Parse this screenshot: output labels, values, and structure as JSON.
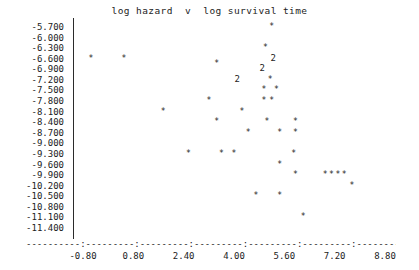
{
  "chart_data": {
    "type": "scatter",
    "title": "log hazard  v  log survival time",
    "xlabel": "",
    "ylabel": "",
    "xlim": [
      -1.6,
      9.6
    ],
    "ylim": [
      -11.55,
      -5.55
    ],
    "grid": false,
    "legend": null,
    "marker": "*",
    "multi_marker_note": "A digit glyph such as '2' marks a location where that many observations coincide.",
    "x_ticks": [
      "-0.80",
      "0.80",
      "2.40",
      "4.00",
      "5.60",
      "7.20",
      "8.80"
    ],
    "x_tick_values": [
      -0.8,
      0.8,
      2.4,
      4.0,
      5.6,
      7.2,
      8.8
    ],
    "y_ticks": [
      "-5.700",
      "-6.000",
      "-6.300",
      "-6.600",
      "-6.900",
      "-7.200",
      "-7.500",
      "-7.800",
      "-8.100",
      "-8.400",
      "-8.700",
      "-9.000",
      "-9.300",
      "-9.600",
      "-9.900",
      "-10.200",
      "-10.500",
      "-10.800",
      "-11.100",
      "-11.400"
    ],
    "y_tick_values": [
      -5.7,
      -6.0,
      -6.3,
      -6.6,
      -6.9,
      -7.2,
      -7.5,
      -7.8,
      -8.1,
      -8.4,
      -8.7,
      -9.0,
      -9.3,
      -9.6,
      -9.9,
      -10.2,
      -10.5,
      -10.8,
      -11.1,
      -11.4
    ],
    "points": [
      {
        "x": 5.2,
        "y": -5.7,
        "count": 1,
        "label": "*"
      },
      {
        "x": 5.0,
        "y": -6.3,
        "count": 1,
        "label": "*"
      },
      {
        "x": -0.55,
        "y": -6.6,
        "count": 1,
        "label": "*"
      },
      {
        "x": 0.5,
        "y": -6.6,
        "count": 1,
        "label": "*"
      },
      {
        "x": 5.25,
        "y": -6.6,
        "count": 2,
        "label": "2"
      },
      {
        "x": 3.45,
        "y": -6.75,
        "count": 1,
        "label": "*"
      },
      {
        "x": 4.9,
        "y": -6.9,
        "count": 2,
        "label": "2"
      },
      {
        "x": 4.1,
        "y": -7.2,
        "count": 2,
        "label": "2"
      },
      {
        "x": 5.15,
        "y": -7.2,
        "count": 1,
        "label": "*"
      },
      {
        "x": 4.95,
        "y": -7.5,
        "count": 1,
        "label": "*"
      },
      {
        "x": 5.35,
        "y": -7.5,
        "count": 1,
        "label": "*"
      },
      {
        "x": 3.2,
        "y": -7.8,
        "count": 1,
        "label": "*"
      },
      {
        "x": 4.95,
        "y": -7.8,
        "count": 1,
        "label": "*"
      },
      {
        "x": 5.2,
        "y": -7.8,
        "count": 1,
        "label": "*"
      },
      {
        "x": 1.75,
        "y": -8.1,
        "count": 1,
        "label": "*"
      },
      {
        "x": 4.25,
        "y": -8.1,
        "count": 1,
        "label": "*"
      },
      {
        "x": 10.55,
        "y": -8.1,
        "count": 1,
        "label": "*"
      },
      {
        "x": 3.45,
        "y": -8.4,
        "count": 1,
        "label": "*"
      },
      {
        "x": 5.05,
        "y": -8.4,
        "count": 1,
        "label": "*"
      },
      {
        "x": 5.95,
        "y": -8.4,
        "count": 1,
        "label": "*"
      },
      {
        "x": 4.45,
        "y": -8.7,
        "count": 1,
        "label": "*"
      },
      {
        "x": 5.45,
        "y": -8.7,
        "count": 1,
        "label": "*"
      },
      {
        "x": 5.95,
        "y": -8.7,
        "count": 1,
        "label": "*"
      },
      {
        "x": 2.55,
        "y": -9.3,
        "count": 1,
        "label": "*"
      },
      {
        "x": 3.6,
        "y": -9.3,
        "count": 1,
        "label": "*"
      },
      {
        "x": 4.0,
        "y": -9.3,
        "count": 1,
        "label": "*"
      },
      {
        "x": 5.9,
        "y": -9.3,
        "count": 1,
        "label": "*"
      },
      {
        "x": 5.45,
        "y": -9.6,
        "count": 1,
        "label": "*"
      },
      {
        "x": 5.95,
        "y": -9.9,
        "count": 1,
        "label": "*"
      },
      {
        "x": 6.9,
        "y": -9.9,
        "count": 1,
        "label": "*"
      },
      {
        "x": 7.1,
        "y": -9.9,
        "count": 1,
        "label": "*"
      },
      {
        "x": 7.3,
        "y": -9.9,
        "count": 1,
        "label": "*"
      },
      {
        "x": 7.5,
        "y": -9.9,
        "count": 1,
        "label": "*"
      },
      {
        "x": 7.75,
        "y": -10.2,
        "count": 1,
        "label": "*"
      },
      {
        "x": 4.7,
        "y": -10.5,
        "count": 1,
        "label": "*"
      },
      {
        "x": 5.45,
        "y": -10.5,
        "count": 1,
        "label": "*"
      },
      {
        "x": 6.2,
        "y": -11.1,
        "count": 1,
        "label": "*"
      }
    ]
  },
  "axis": {
    "x_axis_rule": "----------:---------:---------:---------:---------:---------:---------:"
  }
}
